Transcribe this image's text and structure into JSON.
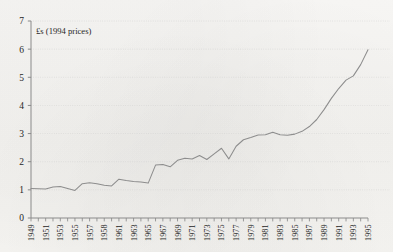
{
  "chart_data": {
    "type": "line",
    "title": "",
    "subtitle": "",
    "annotation": "£s (1994 prices)",
    "xlabel": "",
    "ylabel": "",
    "xlim": [
      1949,
      1995
    ],
    "ylim": [
      0,
      7
    ],
    "y_ticks": [
      0,
      1,
      2,
      3,
      4,
      5,
      6,
      7
    ],
    "y_tick_labels": [
      "0",
      "1",
      "2",
      "3",
      "4",
      "5",
      "6",
      "7"
    ],
    "x_tick_labels": [
      "1949",
      "1951",
      "1953",
      "1955",
      "1957",
      "1958",
      "1961",
      "1963",
      "1965",
      "1967",
      "1969",
      "1971",
      "1973",
      "1975",
      "1977",
      "1979",
      "1981",
      "1983",
      "1985",
      "1987",
      "1989",
      "1991",
      "1993",
      "1995"
    ],
    "x_tick_values": [
      1949,
      1951,
      1953,
      1955,
      1957,
      1959,
      1961,
      1963,
      1965,
      1967,
      1969,
      1971,
      1973,
      1975,
      1977,
      1979,
      1981,
      1983,
      1985,
      1987,
      1989,
      1991,
      1993,
      1995
    ],
    "x_minor_every": 1,
    "grid": "horizontal-dotted",
    "legend": "none",
    "line_color": "#8d8d8d",
    "axis_color": "#8a8a8a",
    "grid_color": "#c9c9c9",
    "series": [
      {
        "name": "value",
        "x": [
          1949,
          1950,
          1951,
          1952,
          1953,
          1954,
          1955,
          1956,
          1957,
          1958,
          1959,
          1960,
          1961,
          1962,
          1963,
          1964,
          1965,
          1966,
          1967,
          1968,
          1969,
          1970,
          1971,
          1972,
          1973,
          1974,
          1975,
          1976,
          1977,
          1978,
          1979,
          1980,
          1981,
          1982,
          1983,
          1984,
          1985,
          1986,
          1987,
          1988,
          1989,
          1990,
          1991,
          1992,
          1993,
          1994,
          1995
        ],
        "values": [
          1.05,
          1.04,
          1.03,
          1.1,
          1.12,
          1.05,
          0.98,
          1.22,
          1.25,
          1.22,
          1.16,
          1.14,
          1.38,
          1.33,
          1.3,
          1.28,
          1.24,
          1.88,
          1.9,
          1.82,
          2.05,
          2.12,
          2.1,
          2.22,
          2.08,
          2.28,
          2.48,
          2.1,
          2.55,
          2.78,
          2.86,
          2.95,
          2.96,
          3.05,
          2.96,
          2.94,
          2.98,
          3.08,
          3.25,
          3.5,
          3.85,
          4.25,
          4.6,
          4.9,
          5.05,
          5.45,
          5.98
        ]
      }
    ]
  }
}
